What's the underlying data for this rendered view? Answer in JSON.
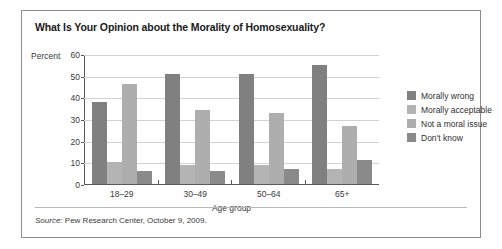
{
  "chart_data": {
    "type": "bar",
    "title": "What Is Your Opinion about the Morality of Homosexuality?",
    "xlabel": "Age group",
    "ylabel": "Percent",
    "ylim": [
      0,
      60
    ],
    "yticks": [
      60,
      50,
      40,
      30,
      20,
      10,
      0
    ],
    "grid": true,
    "legend_position": "right",
    "categories": [
      "18–29",
      "30–49",
      "50–64",
      "65+"
    ],
    "series": [
      {
        "name": "Morally wrong",
        "color": "#808080",
        "values": [
          38,
          51,
          51,
          55
        ]
      },
      {
        "name": "Morally acceptable",
        "color": "#b4b4b4",
        "values": [
          10,
          9,
          9,
          7
        ]
      },
      {
        "name": "Not a moral issue",
        "color": "#aeaeae",
        "values": [
          46,
          34,
          33,
          27
        ]
      },
      {
        "name": "Don't know",
        "color": "#8a8a8a",
        "values": [
          6,
          6,
          7,
          11
        ]
      }
    ]
  },
  "source": {
    "prefix": "Source:",
    "text": "Pew Research Center, October 9, 2009."
  }
}
